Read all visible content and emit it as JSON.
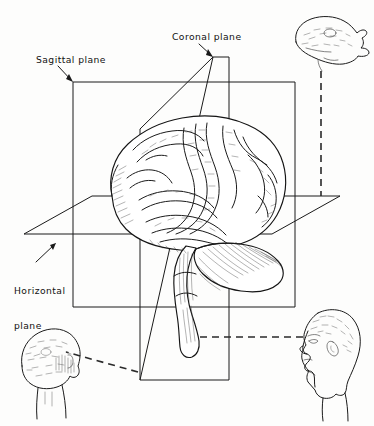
{
  "figure": {
    "background_color": "#fdfdfc",
    "ink_color": "#1a1a1a",
    "width": 374,
    "height": 426
  },
  "labels": {
    "sagittal": "Sagittal plane",
    "coronal": "Coronal plane",
    "horizontal_line1": "Horizontal",
    "horizontal_line2": "plane"
  },
  "planes": [
    {
      "name": "sagittal-plane",
      "label": "Sagittal plane",
      "shape": "rectangle",
      "orientation": "vertical, parallel to picture plane, divides left/right"
    },
    {
      "name": "coronal-plane",
      "label": "Coronal plane",
      "shape": "parallelogram",
      "orientation": "vertical, oblique in depth, divides front/back"
    },
    {
      "name": "horizontal-plane",
      "label": "Horizontal plane",
      "shape": "parallelogram",
      "orientation": "horizontal, divides superior/inferior"
    }
  ],
  "brain": {
    "name": "brain-illustration",
    "parts": [
      "cerebrum",
      "cerebellum",
      "brainstem"
    ],
    "view": "left lateral, three-quarter"
  },
  "heads": [
    {
      "name": "head-superior-view",
      "position": "top-right",
      "view": "superior (top-down) view of head",
      "links_to": "horizontal-plane"
    },
    {
      "name": "head-posterior-view",
      "position": "bottom-left",
      "view": "posterior (back) view of head",
      "links_to": "coronal-plane"
    },
    {
      "name": "head-lateral-view",
      "position": "bottom-right",
      "view": "lateral (profile) view of head facing left",
      "links_to": "sagittal-plane"
    }
  ],
  "connectors": [
    {
      "name": "connector-horizontal-to-superior-head",
      "style": "dashed",
      "direction": "vertical"
    },
    {
      "name": "connector-coronal-to-posterior-head",
      "style": "dashed",
      "direction": "diagonal"
    },
    {
      "name": "connector-sagittal-to-lateral-head",
      "style": "dashed",
      "direction": "horizontal"
    }
  ]
}
